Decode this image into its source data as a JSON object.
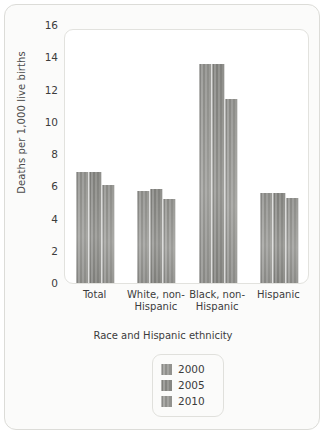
{
  "chart_data": {
    "type": "bar",
    "title": "",
    "subtitle": "",
    "xlabel": "Race and Hispanic ethnicity",
    "ylabel": "Deaths per 1,000 live births",
    "categories": [
      "Total",
      "White, non-Hispanic",
      "Black, non-Hispanic",
      "Hispanic"
    ],
    "category_lines": [
      [
        "Total"
      ],
      [
        "White, non-",
        "Hispanic"
      ],
      [
        "Black, non-",
        "Hispanic"
      ],
      [
        "Hispanic"
      ]
    ],
    "series": [
      {
        "name": "2000",
        "values": [
          6.9,
          5.7,
          13.6,
          5.6
        ],
        "color": "#9a9a96"
      },
      {
        "name": "2005",
        "values": [
          6.9,
          5.8,
          13.6,
          5.6
        ],
        "color": "#8e8e8a"
      },
      {
        "name": "2010",
        "values": [
          6.1,
          5.2,
          11.4,
          5.3
        ],
        "color": "#9a9a96"
      }
    ],
    "ylim": [
      0,
      16
    ],
    "ytick_labels": [
      "16",
      "14",
      "12",
      "10",
      "8",
      "6",
      "4",
      "2",
      "0"
    ],
    "ytick_values": [
      16,
      14,
      12,
      10,
      8,
      6,
      4,
      2,
      0
    ],
    "grid": false,
    "legend_position": "bottom-center",
    "legend_entries": [
      "2000",
      "2005",
      "2010"
    ]
  }
}
